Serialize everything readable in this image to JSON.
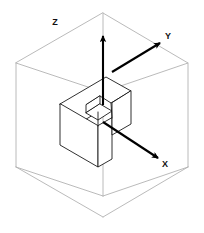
{
  "figure": {
    "background_color": "#ffffff",
    "wireframe_color": "#b0b0b0",
    "solid_edge_color": "#1a1a1a",
    "axis_color": "#000000",
    "width": 204,
    "height": 233
  },
  "axes": [
    {
      "name": "z-axis",
      "label": "Z",
      "label_x": 55,
      "label_y": 25,
      "direction": "up",
      "start_x": 103,
      "start_y": 105,
      "end_x": 103,
      "end_y": 36
    },
    {
      "name": "y-axis",
      "label": "Y",
      "label_x": 168,
      "label_y": 39,
      "direction": "upper-right",
      "start_x": 112,
      "start_y": 72,
      "end_x": 160,
      "end_y": 43
    },
    {
      "name": "x-axis",
      "label": "X",
      "label_x": 165,
      "label_y": 167,
      "direction": "lower-right",
      "start_x": 103,
      "start_y": 122,
      "end_x": 158,
      "end_y": 158
    }
  ],
  "bounding_cube": {
    "name": "bounding-cube",
    "vertices": {
      "top_apex": [
        103,
        13
      ],
      "top_left": [
        16,
        63
      ],
      "top_right": [
        188,
        63
      ],
      "top_center": [
        103,
        92
      ],
      "bottom_apex": [
        103,
        217
      ],
      "bottom_left": [
        16,
        167
      ],
      "bottom_right": [
        188,
        167
      ],
      "bottom_center": [
        103,
        196
      ]
    }
  },
  "solid_object": {
    "name": "notched-block",
    "description": "rectangular block with a rectangular slot cut into its top-right face"
  }
}
